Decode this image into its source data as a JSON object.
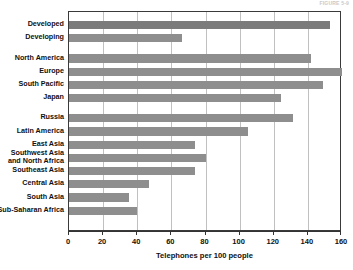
{
  "top_caption": "FIGURE 5-9",
  "chart_data": {
    "type": "bar",
    "orientation": "horizontal",
    "title": "",
    "xlabel": "Telephones per 100 people",
    "ylabel": "",
    "xlim": [
      0,
      160
    ],
    "xticks": [
      0,
      20,
      40,
      60,
      80,
      100,
      120,
      140,
      160
    ],
    "grid": true,
    "legend": false,
    "categories": [
      "Developed",
      "Developing",
      "North America",
      "Europe",
      "South Pacific",
      "Japan",
      "Russia",
      "Latin America",
      "East Asia",
      "Southwest Asia and North Africa",
      "Southeast Asia",
      "Central Asia",
      "South Asia",
      "Sub-Saharan Africa"
    ],
    "values": [
      153,
      66,
      142,
      160,
      149,
      124,
      131,
      105,
      74,
      80,
      74,
      47,
      35,
      40
    ],
    "groups": [
      {
        "name": "summary",
        "categories": [
          "Developed",
          "Developing"
        ]
      },
      {
        "name": "regions-high",
        "categories": [
          "North America",
          "Europe",
          "South Pacific",
          "Japan"
        ]
      },
      {
        "name": "regions-other",
        "categories": [
          "Russia",
          "Latin America",
          "East Asia",
          "Southwest Asia and North Africa",
          "Southeast Asia",
          "Central Asia",
          "South Asia",
          "Sub-Saharan Africa"
        ]
      }
    ],
    "colors": {
      "bar": "#8e8e8e",
      "bar_dark": "#7b7b7b",
      "gridline": "#c0c0c0",
      "axis": "#333333",
      "text": "#111111",
      "background": "#ffffff"
    }
  },
  "labels": [
    {
      "text": "Developed",
      "two_line": false
    },
    {
      "text": "Developing",
      "two_line": false
    },
    {
      "text": "North America",
      "two_line": false
    },
    {
      "text": "Europe",
      "two_line": false
    },
    {
      "text": "South Pacific",
      "two_line": false
    },
    {
      "text": "Japan",
      "two_line": false
    },
    {
      "text": "Russia",
      "two_line": false
    },
    {
      "text": "Latin America",
      "two_line": false
    },
    {
      "text": "East Asia",
      "two_line": false
    },
    {
      "text": "Southwest Asia and North Africa",
      "two_line": true
    },
    {
      "text": "Southeast Asia",
      "two_line": false
    },
    {
      "text": "Central Asia",
      "two_line": false
    },
    {
      "text": "South Asia",
      "two_line": false
    },
    {
      "text": "Sub-Saharan Africa",
      "two_line": false
    }
  ]
}
